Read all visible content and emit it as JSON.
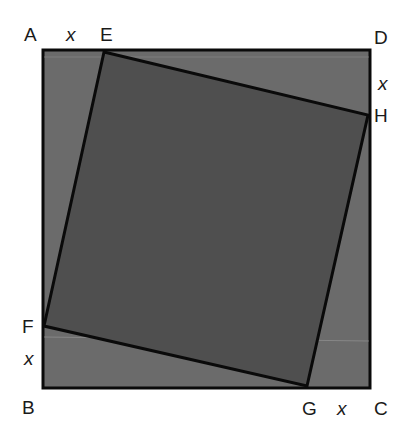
{
  "diagram": {
    "colors": {
      "background": "#ffffff",
      "outer_fill": "#6b6b6b",
      "inner_fill": "#4f4f4f",
      "stroke": "#0a0a0a"
    },
    "outer_square": {
      "points": [
        [
          43,
          50
        ],
        [
          370,
          50
        ],
        [
          370,
          388
        ],
        [
          43,
          388
        ]
      ]
    },
    "inner_square": {
      "points": [
        [
          104,
          52
        ],
        [
          368,
          115
        ],
        [
          307,
          386
        ],
        [
          44,
          326
        ]
      ]
    },
    "labels": {
      "A": "A",
      "B": "B",
      "C": "C",
      "D": "D",
      "E": "E",
      "F": "F",
      "G": "G",
      "H": "H",
      "x_top": "x",
      "x_right": "x",
      "x_left": "x",
      "x_bottom": "x"
    }
  }
}
